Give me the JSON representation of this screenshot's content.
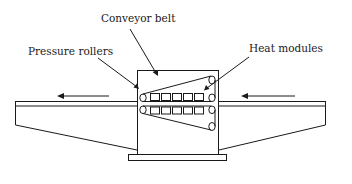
{
  "diagram": {
    "type": "conveyor-dryer-schematic",
    "labels": {
      "conveyor_belt": "Conveyor belt",
      "pressure_rollers": "Pressure rollers",
      "heat_modules": "Heat modules"
    },
    "heat_modules_per_row": 5,
    "heat_module_rows": 2,
    "flow_direction": "right-to-left",
    "colors": {
      "stroke": "#1a1a1a",
      "background": "#ffffff"
    }
  }
}
